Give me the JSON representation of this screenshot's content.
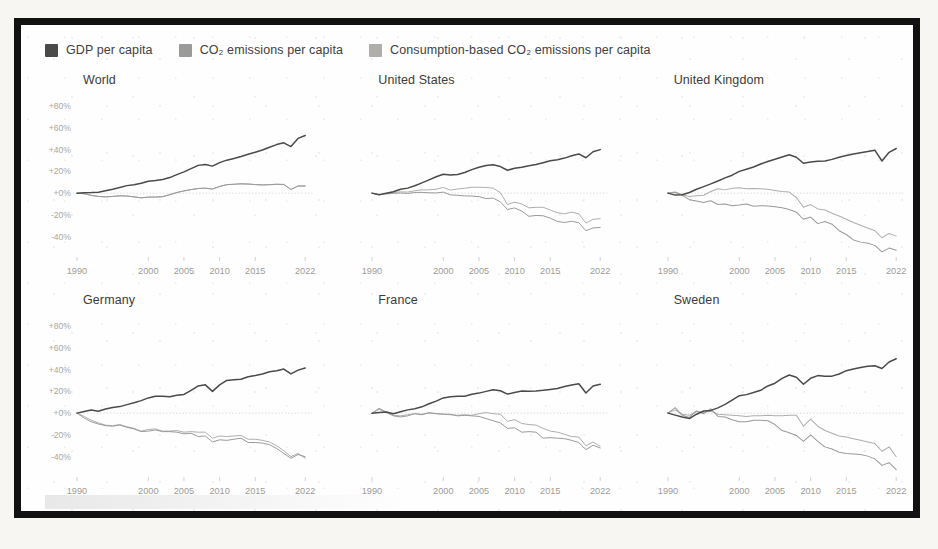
{
  "legend": {
    "items": [
      {
        "label": "GDP per capita",
        "key": "gdp",
        "color": "#4a4a48",
        "swatch_name": "legend-swatch-gdp"
      },
      {
        "label": "CO₂ emissions per capita",
        "key": "co2",
        "color": "#9a9a98",
        "swatch_name": "legend-swatch-co2"
      },
      {
        "label": "Consumption-based CO₂ emissions per capita",
        "key": "cbco2",
        "color": "#b0aeab",
        "swatch_name": "legend-swatch-cbco2"
      }
    ]
  },
  "axes": {
    "y_ticks": [
      "+80%",
      "+60%",
      "+40%",
      "+20%",
      "+0%",
      "-20%",
      "-40%"
    ],
    "y_values": [
      80,
      60,
      40,
      20,
      0,
      -20,
      -40
    ],
    "x_ticks": [
      "1990",
      "2000",
      "2005",
      "2010",
      "2015",
      "2022"
    ],
    "x_tick_values": [
      1990,
      2000,
      2005,
      2010,
      2015,
      2022
    ],
    "ylim": [
      -55,
      92
    ],
    "xlim": [
      1990,
      2023
    ]
  },
  "panels": [
    {
      "title": "World",
      "name": "panel-world",
      "show_y_labels": true
    },
    {
      "title": "United States",
      "name": "panel-united-states",
      "show_y_labels": false
    },
    {
      "title": "United Kingdom",
      "name": "panel-united-kingdom",
      "show_y_labels": false
    },
    {
      "title": "Germany",
      "name": "panel-germany",
      "show_y_labels": true
    },
    {
      "title": "France",
      "name": "panel-france",
      "show_y_labels": false
    },
    {
      "title": "Sweden",
      "name": "panel-sweden",
      "show_y_labels": false
    }
  ],
  "chart_data": {
    "type": "line",
    "title": "",
    "subtitle": "",
    "xlabel": "",
    "ylabel": "Percentage change since 1990",
    "grid": false,
    "legend_position": "top-left",
    "xlim": [
      1990,
      2023
    ],
    "ylim": [
      -55,
      92
    ],
    "x": [
      1990,
      1991,
      1992,
      1993,
      1994,
      1995,
      1996,
      1997,
      1998,
      1999,
      2000,
      2001,
      2002,
      2003,
      2004,
      2005,
      2006,
      2007,
      2008,
      2009,
      2010,
      2011,
      2012,
      2013,
      2014,
      2015,
      2016,
      2017,
      2018,
      2019,
      2020,
      2021,
      2022
    ],
    "series_names": [
      "GDP per capita",
      "CO₂ emissions per capita",
      "Consumption-based CO₂ emissions per capita"
    ],
    "panels": [
      {
        "name": "World",
        "series": [
          {
            "name": "GDP per capita",
            "key": "gdp",
            "color": "#4a4a48",
            "values": [
              0,
              0.3,
              0.5,
              0.9,
              2.2,
              3.5,
              5.2,
              6.9,
              7.8,
              9.0,
              11.0,
              11.6,
              12.6,
              14.3,
              17.0,
              19.5,
              22.5,
              25.5,
              26.4,
              24.8,
              28.0,
              30.3,
              31.9,
              33.7,
              35.7,
              37.6,
              39.6,
              42.2,
              44.6,
              46.2,
              42.8,
              50.3,
              53.0
            ]
          },
          {
            "name": "CO₂ emissions per capita",
            "key": "co2",
            "color": "#9a9a98",
            "values": [
              0,
              -0.5,
              -2.0,
              -3.0,
              -3.4,
              -3.0,
              -2.4,
              -2.6,
              -3.4,
              -4.3,
              -3.6,
              -3.6,
              -3.2,
              -1.4,
              0.6,
              2.1,
              3.3,
              4.3,
              4.6,
              3.8,
              6.2,
              7.8,
              8.2,
              8.6,
              8.4,
              7.9,
              7.6,
              7.8,
              8.2,
              8.0,
              3.4,
              6.6,
              6.6
            ]
          },
          {
            "name": "Consumption-based CO₂ emissions per capita",
            "key": "cbco2",
            "color": "#b0aeab",
            "values": [
              0,
              -0.6,
              -2.1,
              -3.1,
              -3.5,
              -3.1,
              -2.5,
              -2.7,
              -3.5,
              -4.4,
              -3.7,
              -3.7,
              -3.3,
              -1.5,
              0.5,
              2.0,
              3.2,
              4.2,
              4.5,
              3.7,
              6.1,
              7.7,
              8.1,
              8.5,
              8.3,
              7.8,
              7.5,
              7.7,
              8.1,
              7.9,
              3.3,
              6.5,
              6.5
            ]
          }
        ]
      },
      {
        "name": "United States",
        "series": [
          {
            "name": "GDP per capita",
            "key": "gdp",
            "color": "#4a4a48",
            "values": [
              0,
              -1.4,
              0.0,
              1.2,
              3.5,
              4.6,
              6.8,
              9.4,
              12.2,
              15.1,
              17.3,
              16.7,
              17.2,
              18.9,
              21.6,
              23.8,
              25.4,
              26.0,
              24.4,
              21.0,
              22.8,
              23.8,
              25.2,
              26.3,
              28.0,
              29.7,
              30.6,
              32.2,
              34.4,
              36.0,
              32.5,
              38.0,
              40.0
            ]
          },
          {
            "name": "CO₂ emissions per capita",
            "key": "co2",
            "color": "#9a9a98",
            "values": [
              0,
              -1.5,
              -0.8,
              -0.2,
              0.1,
              -0.3,
              0.6,
              0.7,
              0.3,
              0.2,
              0.9,
              -1.6,
              -2.0,
              -2.5,
              -2.7,
              -3.2,
              -5.0,
              -4.6,
              -8.0,
              -15.0,
              -13.6,
              -16.5,
              -21.3,
              -20.5,
              -20.8,
              -23.0,
              -26.0,
              -27.0,
              -25.8,
              -27.2,
              -34.5,
              -32.0,
              -31.5
            ]
          },
          {
            "name": "Consumption-based CO₂ emissions per capita",
            "key": "cbco2",
            "color": "#b0aeab",
            "values": [
              0,
              -1.4,
              -0.4,
              0.6,
              1.2,
              1.0,
              2.2,
              3.0,
              3.0,
              3.6,
              5.2,
              2.8,
              3.8,
              4.5,
              5.4,
              5.4,
              5.2,
              4.6,
              0.4,
              -10.5,
              -8.2,
              -10.0,
              -13.5,
              -13.0,
              -13.0,
              -15.5,
              -18.0,
              -19.0,
              -17.5,
              -19.0,
              -27.5,
              -24.0,
              -23.5
            ]
          }
        ]
      },
      {
        "name": "United Kingdom",
        "series": [
          {
            "name": "GDP per capita",
            "key": "gdp",
            "color": "#4a4a48",
            "values": [
              0,
              -1.8,
              -1.5,
              0.6,
              3.6,
              6.0,
              8.5,
              11.2,
              14.0,
              16.5,
              20.0,
              22.0,
              24.0,
              26.8,
              29.0,
              31.2,
              33.2,
              35.2,
              33.0,
              27.5,
              28.6,
              29.2,
              29.6,
              31.0,
              33.0,
              34.6,
              36.0,
              37.2,
              38.2,
              39.5,
              29.5,
              37.5,
              41.0
            ]
          },
          {
            "name": "CO₂ emissions per capita",
            "key": "co2",
            "color": "#9a9a98",
            "values": [
              0,
              1.0,
              -2.0,
              -6.0,
              -7.2,
              -8.5,
              -7.0,
              -10.5,
              -10.0,
              -11.5,
              -11.0,
              -10.0,
              -12.0,
              -11.5,
              -11.8,
              -12.5,
              -13.5,
              -15.0,
              -17.5,
              -24.0,
              -22.0,
              -28.0,
              -26.0,
              -28.5,
              -34.5,
              -38.0,
              -43.0,
              -45.0,
              -46.0,
              -48.0,
              -54.0,
              -50.5,
              -52.5
            ]
          },
          {
            "name": "Consumption-based CO₂ emissions per capita",
            "key": "cbco2",
            "color": "#b0aeab",
            "values": [
              0,
              0.5,
              -1.5,
              -3.0,
              -2.5,
              -2.0,
              1.5,
              4.0,
              3.0,
              4.5,
              5.0,
              4.0,
              4.2,
              4.0,
              3.5,
              2.5,
              1.5,
              1.0,
              -4.0,
              -13.0,
              -10.5,
              -14.5,
              -15.5,
              -18.5,
              -21.0,
              -24.0,
              -27.0,
              -29.5,
              -32.0,
              -34.5,
              -41.0,
              -37.0,
              -39.5
            ]
          }
        ]
      },
      {
        "name": "Germany",
        "series": [
          {
            "name": "GDP per capita",
            "key": "gdp",
            "color": "#4a4a48",
            "values": [
              0,
              1.5,
              2.8,
              1.8,
              3.8,
              5.2,
              6.0,
              7.8,
              9.5,
              11.5,
              14.0,
              15.6,
              15.4,
              15.0,
              16.4,
              17.2,
              21.0,
              25.0,
              26.0,
              20.0,
              26.0,
              30.0,
              30.6,
              31.2,
              33.5,
              34.6,
              36.0,
              38.0,
              39.0,
              40.5,
              36.0,
              39.5,
              41.5
            ]
          },
          {
            "name": "CO₂ emissions per capita",
            "key": "co2",
            "color": "#9a9a98",
            "values": [
              0,
              -4.5,
              -8.0,
              -10.0,
              -11.5,
              -12.0,
              -11.0,
              -13.0,
              -14.5,
              -17.0,
              -16.5,
              -15.5,
              -17.0,
              -17.0,
              -17.5,
              -19.0,
              -18.5,
              -21.5,
              -21.0,
              -26.5,
              -24.5,
              -25.0,
              -24.0,
              -23.0,
              -27.0,
              -27.0,
              -27.5,
              -29.0,
              -32.5,
              -37.0,
              -41.5,
              -38.0,
              -40.0
            ]
          },
          {
            "name": "Consumption-based CO₂ emissions per capita",
            "key": "cbco2",
            "color": "#b0aeab",
            "values": [
              0,
              -3.0,
              -6.5,
              -9.0,
              -11.0,
              -11.5,
              -10.5,
              -12.5,
              -14.0,
              -16.5,
              -15.0,
              -14.5,
              -16.5,
              -16.5,
              -16.0,
              -17.5,
              -17.0,
              -17.5,
              -17.5,
              -23.0,
              -21.0,
              -21.5,
              -21.0,
              -20.5,
              -24.0,
              -24.0,
              -25.0,
              -26.5,
              -30.0,
              -34.5,
              -40.0,
              -37.0,
              -41.5
            ]
          }
        ]
      },
      {
        "name": "France",
        "series": [
          {
            "name": "GDP per capita",
            "key": "gdp",
            "color": "#4a4a48",
            "values": [
              0,
              0.5,
              1.0,
              -0.5,
              1.3,
              3.0,
              4.0,
              5.8,
              8.6,
              11.0,
              14.0,
              15.0,
              15.4,
              15.6,
              17.4,
              18.4,
              20.0,
              21.5,
              20.6,
              17.5,
              19.0,
              20.4,
              20.0,
              20.4,
              21.0,
              21.8,
              22.6,
              24.5,
              25.8,
              27.0,
              18.5,
              25.0,
              26.5
            ]
          },
          {
            "name": "CO₂ emissions per capita",
            "key": "co2",
            "color": "#9a9a98",
            "values": [
              0,
              4.5,
              1.0,
              -2.5,
              -3.5,
              -2.5,
              -0.5,
              -1.5,
              0.5,
              -0.5,
              -1.0,
              -1.0,
              -2.5,
              -2.0,
              -2.5,
              -3.0,
              -5.0,
              -7.0,
              -9.0,
              -14.0,
              -13.5,
              -17.5,
              -17.0,
              -17.5,
              -23.0,
              -22.5,
              -23.0,
              -23.5,
              -25.0,
              -27.0,
              -33.5,
              -29.5,
              -32.0
            ]
          },
          {
            "name": "Consumption-based CO₂ emissions per capita",
            "key": "cbco2",
            "color": "#b0aeab",
            "values": [
              0,
              3.5,
              0.5,
              -2.0,
              -2.5,
              -1.5,
              -0.5,
              -1.0,
              0.0,
              -0.5,
              -1.0,
              -1.5,
              -2.0,
              -1.5,
              -2.0,
              -0.5,
              0.5,
              -0.5,
              -1.0,
              -7.5,
              -6.0,
              -9.5,
              -10.5,
              -11.0,
              -14.0,
              -16.5,
              -17.5,
              -19.5,
              -21.5,
              -22.0,
              -30.0,
              -26.5,
              -30.5
            ]
          }
        ]
      },
      {
        "name": "Sweden",
        "series": [
          {
            "name": "GDP per capita",
            "key": "gdp",
            "color": "#4a4a48",
            "values": [
              0,
              -1.8,
              -3.5,
              -5.0,
              -1.0,
              2.0,
              2.5,
              4.8,
              8.0,
              12.0,
              16.0,
              17.0,
              19.0,
              21.0,
              25.0,
              27.5,
              32.0,
              35.0,
              33.0,
              26.5,
              32.0,
              34.5,
              33.8,
              34.0,
              36.0,
              39.0,
              40.5,
              42.0,
              43.0,
              43.5,
              41.0,
              47.0,
              50.0
            ]
          },
          {
            "name": "CO₂ emissions per capita",
            "key": "co2",
            "color": "#9a9a98",
            "values": [
              0,
              5.0,
              -2.0,
              -4.0,
              2.0,
              -0.5,
              4.0,
              -3.0,
              -3.5,
              -6.0,
              -8.0,
              -8.0,
              -6.5,
              -6.5,
              -7.0,
              -10.5,
              -16.0,
              -18.0,
              -20.5,
              -26.0,
              -20.0,
              -26.0,
              -31.0,
              -33.0,
              -36.0,
              -37.0,
              -37.5,
              -38.0,
              -39.5,
              -42.0,
              -48.0,
              -45.5,
              -52.0
            ]
          },
          {
            "name": "Consumption-based CO₂ emissions per capita",
            "key": "cbco2",
            "color": "#b0aeab",
            "values": [
              0,
              3.0,
              -1.0,
              -2.0,
              1.5,
              0.5,
              2.0,
              -1.0,
              -1.5,
              -2.0,
              -2.5,
              -3.0,
              -2.5,
              -2.5,
              -2.0,
              -2.5,
              -2.5,
              -2.0,
              -2.0,
              -12.0,
              -5.5,
              -12.0,
              -16.0,
              -18.5,
              -21.0,
              -22.0,
              -23.5,
              -25.0,
              -26.5,
              -28.0,
              -35.0,
              -31.0,
              -40.0
            ]
          }
        ]
      }
    ]
  }
}
